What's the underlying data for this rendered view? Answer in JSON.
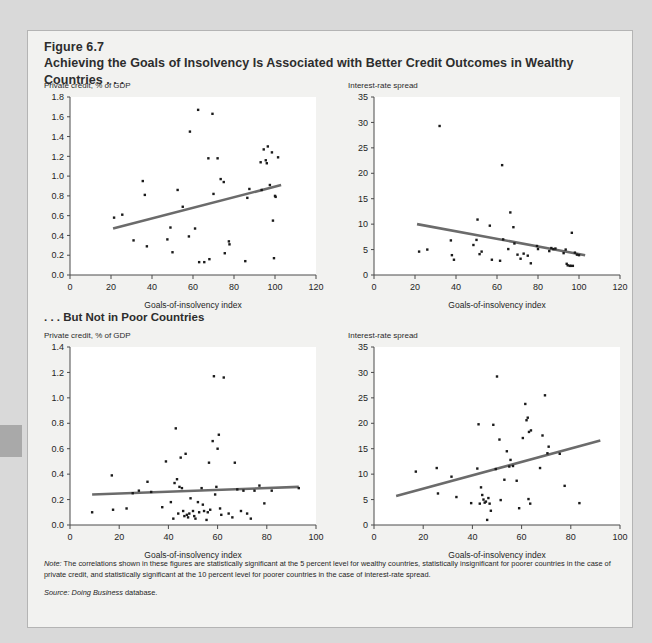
{
  "figure": {
    "number": "Figure 6.7",
    "title": "Achieving the Goals of Insolvency Is Associated with Better Credit Outcomes in Wealthy Countries . . .",
    "section_two_title": ". . . But Not in Poor Countries",
    "note_label": "Note:",
    "note_text": " The correlations shown in these figures are statistically significant at the 5 percent level for wealthy countries, statistically insignificant for poorer countries in the case of private credit, and statistically significant at the 10 percent level for poorer countries in the case of interest-rate spread.",
    "source_label": "Source:",
    "source_italic": " Doing Business",
    "source_rest": " database.",
    "colors": {
      "panel_bg": "#f2f2f0",
      "page_bg": "#d9d9d9",
      "border": "#b4b4b4",
      "trendline": "#6b6b6b",
      "point": "#1a1a1a",
      "axis": "#4a4a4a",
      "text": "#2d2d2d"
    }
  },
  "chart_data": [
    {
      "id": "wealthy-private-credit",
      "type": "scatter",
      "title": "Private credit, % of GDP",
      "xlabel": "Goals-of-insolvency index",
      "ylabel": "",
      "xlim": [
        0,
        120
      ],
      "ylim": [
        0.0,
        1.8
      ],
      "xticks": [
        0,
        20,
        40,
        60,
        80,
        100,
        120
      ],
      "yticks": [
        "0.0",
        "0.2",
        "0.4",
        "0.6",
        "0.8",
        "1.0",
        "1.2",
        "1.4",
        "1.6",
        "1.8"
      ],
      "grid": false,
      "legend": "none",
      "trendline": {
        "x0": 21,
        "y0": 0.47,
        "x1": 103,
        "y1": 0.91
      },
      "points": [
        [
          21.5,
          0.58
        ],
        [
          25.5,
          0.61
        ],
        [
          31.0,
          0.35
        ],
        [
          35.5,
          0.95
        ],
        [
          36.5,
          0.81
        ],
        [
          37.5,
          0.29
        ],
        [
          47.5,
          0.36
        ],
        [
          49.0,
          0.48
        ],
        [
          50.0,
          0.23
        ],
        [
          52.5,
          0.86
        ],
        [
          55.0,
          0.69
        ],
        [
          58.0,
          0.39
        ],
        [
          58.5,
          1.45
        ],
        [
          61.0,
          0.47
        ],
        [
          62.5,
          1.67
        ],
        [
          63.0,
          0.13
        ],
        [
          65.5,
          0.13
        ],
        [
          67.5,
          1.18
        ],
        [
          68.0,
          0.16
        ],
        [
          69.5,
          1.63
        ],
        [
          70.0,
          0.82
        ],
        [
          72.0,
          1.18
        ],
        [
          73.5,
          0.97
        ],
        [
          75.0,
          0.94
        ],
        [
          75.5,
          0.22
        ],
        [
          77.5,
          0.34
        ],
        [
          77.8,
          0.31
        ],
        [
          85.5,
          0.14
        ],
        [
          86.5,
          0.78
        ],
        [
          87.5,
          0.87
        ],
        [
          93.0,
          1.14
        ],
        [
          93.5,
          0.86
        ],
        [
          94.5,
          1.27
        ],
        [
          95.5,
          1.16
        ],
        [
          96.0,
          1.13
        ],
        [
          96.5,
          1.3
        ],
        [
          97.5,
          0.91
        ],
        [
          98.5,
          1.24
        ],
        [
          99.0,
          0.55
        ],
        [
          99.5,
          0.17
        ],
        [
          100.0,
          0.8
        ],
        [
          100.3,
          0.79
        ],
        [
          101.5,
          1.19
        ]
      ]
    },
    {
      "id": "wealthy-interest-spread",
      "type": "scatter",
      "title": "Interest-rate spread",
      "xlabel": "Goals-of-insolvency index",
      "ylabel": "",
      "xlim": [
        0,
        120
      ],
      "ylim": [
        0,
        35
      ],
      "xticks": [
        0,
        20,
        40,
        60,
        80,
        100,
        120
      ],
      "yticks": [
        "0",
        "5",
        "10",
        "15",
        "20",
        "25",
        "30",
        "35"
      ],
      "grid": false,
      "legend": "none",
      "trendline": {
        "x0": 21,
        "y0": 10.0,
        "x1": 103,
        "y1": 3.9
      },
      "points": [
        [
          22.0,
          4.6
        ],
        [
          26.0,
          5.0
        ],
        [
          32.0,
          29.3
        ],
        [
          37.5,
          6.8
        ],
        [
          38.0,
          3.9
        ],
        [
          39.0,
          3.0
        ],
        [
          48.5,
          5.9
        ],
        [
          50.0,
          6.9
        ],
        [
          50.5,
          10.9
        ],
        [
          51.5,
          4.1
        ],
        [
          52.5,
          4.6
        ],
        [
          56.5,
          9.7
        ],
        [
          57.5,
          3.0
        ],
        [
          61.5,
          2.8
        ],
        [
          62.5,
          21.6
        ],
        [
          63.0,
          7.0
        ],
        [
          65.5,
          5.1
        ],
        [
          66.5,
          12.3
        ],
        [
          68.0,
          9.4
        ],
        [
          68.5,
          6.2
        ],
        [
          70.0,
          4.0
        ],
        [
          71.5,
          3.2
        ],
        [
          73.0,
          4.2
        ],
        [
          75.0,
          3.8
        ],
        [
          76.5,
          2.3
        ],
        [
          79.5,
          5.7
        ],
        [
          80.0,
          5.1
        ],
        [
          85.5,
          4.7
        ],
        [
          86.5,
          5.3
        ],
        [
          87.5,
          5.1
        ],
        [
          88.5,
          5.2
        ],
        [
          92.5,
          4.3
        ],
        [
          93.5,
          5.0
        ],
        [
          94.0,
          2.2
        ],
        [
          94.5,
          1.9
        ],
        [
          95.5,
          1.8
        ],
        [
          96.0,
          1.8
        ],
        [
          96.5,
          8.3
        ],
        [
          97.0,
          1.8
        ],
        [
          98.0,
          4.4
        ],
        [
          99.0,
          4.0
        ],
        [
          100.0,
          3.9
        ]
      ]
    },
    {
      "id": "poor-private-credit",
      "type": "scatter",
      "title": "Private credit, % of GDP",
      "xlabel": "Goals-of-insolvency index",
      "ylabel": "",
      "xlim": [
        0,
        100
      ],
      "ylim": [
        0.0,
        1.4
      ],
      "xticks": [
        0,
        20,
        40,
        60,
        80,
        100
      ],
      "yticks": [
        "0.0",
        "0.2",
        "0.4",
        "0.6",
        "0.8",
        "1.0",
        "1.2",
        "1.4"
      ],
      "grid": false,
      "legend": "none",
      "trendline": {
        "x0": 9,
        "y0": 0.24,
        "x1": 93,
        "y1": 0.3
      },
      "points": [
        [
          9.0,
          0.1
        ],
        [
          17.0,
          0.39
        ],
        [
          17.5,
          0.12
        ],
        [
          23.0,
          0.13
        ],
        [
          25.5,
          0.25
        ],
        [
          28.0,
          0.27
        ],
        [
          31.5,
          0.34
        ],
        [
          33.0,
          0.26
        ],
        [
          37.5,
          0.14
        ],
        [
          39.0,
          0.5
        ],
        [
          41.0,
          0.18
        ],
        [
          42.0,
          0.05
        ],
        [
          42.5,
          0.33
        ],
        [
          43.0,
          0.76
        ],
        [
          43.5,
          0.36
        ],
        [
          44.0,
          0.09
        ],
        [
          44.5,
          0.3
        ],
        [
          45.0,
          0.53
        ],
        [
          45.5,
          0.29
        ],
        [
          46.0,
          0.11
        ],
        [
          46.5,
          0.07
        ],
        [
          47.0,
          0.56
        ],
        [
          47.5,
          0.08
        ],
        [
          48.0,
          0.06
        ],
        [
          48.5,
          0.09
        ],
        [
          49.0,
          0.21
        ],
        [
          50.0,
          0.11
        ],
        [
          50.5,
          0.07
        ],
        [
          51.0,
          0.05
        ],
        [
          52.0,
          0.18
        ],
        [
          52.5,
          0.1
        ],
        [
          53.5,
          0.29
        ],
        [
          54.0,
          0.16
        ],
        [
          54.5,
          0.11
        ],
        [
          55.5,
          0.04
        ],
        [
          56.0,
          0.1
        ],
        [
          56.5,
          0.49
        ],
        [
          57.0,
          0.12
        ],
        [
          58.0,
          0.66
        ],
        [
          58.5,
          1.17
        ],
        [
          59.0,
          0.24
        ],
        [
          59.5,
          0.3
        ],
        [
          60.0,
          0.6
        ],
        [
          60.5,
          0.71
        ],
        [
          61.0,
          0.13
        ],
        [
          61.5,
          0.08
        ],
        [
          62.5,
          1.16
        ],
        [
          64.5,
          0.09
        ],
        [
          66.0,
          0.06
        ],
        [
          67.0,
          0.49
        ],
        [
          68.0,
          0.28
        ],
        [
          69.5,
          0.11
        ],
        [
          70.5,
          0.27
        ],
        [
          72.0,
          0.09
        ],
        [
          73.5,
          0.05
        ],
        [
          75.0,
          0.27
        ],
        [
          77.0,
          0.31
        ],
        [
          79.0,
          0.17
        ],
        [
          82.0,
          0.27
        ],
        [
          93.0,
          0.29
        ]
      ]
    },
    {
      "id": "poor-interest-spread",
      "type": "scatter",
      "title": "Interest-rate spread",
      "xlabel": "Goals-of-insolvency index",
      "ylabel": "",
      "xlim": [
        0,
        100
      ],
      "ylim": [
        0,
        35
      ],
      "xticks": [
        0,
        20,
        40,
        60,
        80,
        100
      ],
      "yticks": [
        "0",
        "5",
        "10",
        "15",
        "20",
        "25",
        "30",
        "35"
      ],
      "grid": false,
      "legend": "none",
      "trendline": {
        "x0": 9,
        "y0": 5.7,
        "x1": 92,
        "y1": 16.6
      },
      "points": [
        [
          17.0,
          10.5
        ],
        [
          25.5,
          11.2
        ],
        [
          26.0,
          6.2
        ],
        [
          31.5,
          9.5
        ],
        [
          33.5,
          5.5
        ],
        [
          39.5,
          4.3
        ],
        [
          42.0,
          11.1
        ],
        [
          42.5,
          19.8
        ],
        [
          43.0,
          4.2
        ],
        [
          43.5,
          7.4
        ],
        [
          44.0,
          5.9
        ],
        [
          44.5,
          5.0
        ],
        [
          45.0,
          4.4
        ],
        [
          45.5,
          4.6
        ],
        [
          46.0,
          1.0
        ],
        [
          46.5,
          5.3
        ],
        [
          47.0,
          4.2
        ],
        [
          47.5,
          2.8
        ],
        [
          48.5,
          19.7
        ],
        [
          49.5,
          11.0
        ],
        [
          50.0,
          29.2
        ],
        [
          51.0,
          16.8
        ],
        [
          51.5,
          4.9
        ],
        [
          53.0,
          8.9
        ],
        [
          54.0,
          14.5
        ],
        [
          55.0,
          11.5
        ],
        [
          55.5,
          12.8
        ],
        [
          56.5,
          11.6
        ],
        [
          58.0,
          8.7
        ],
        [
          59.0,
          3.3
        ],
        [
          60.5,
          17.1
        ],
        [
          61.5,
          23.8
        ],
        [
          62.0,
          20.6
        ],
        [
          62.5,
          21.1
        ],
        [
          62.8,
          5.1
        ],
        [
          63.0,
          18.3
        ],
        [
          63.5,
          4.2
        ],
        [
          63.8,
          18.6
        ],
        [
          67.5,
          11.2
        ],
        [
          68.5,
          17.6
        ],
        [
          69.5,
          25.5
        ],
        [
          70.5,
          14.1
        ],
        [
          71.0,
          15.4
        ],
        [
          75.5,
          14.0
        ],
        [
          77.5,
          7.7
        ],
        [
          83.5,
          4.3
        ]
      ]
    }
  ]
}
